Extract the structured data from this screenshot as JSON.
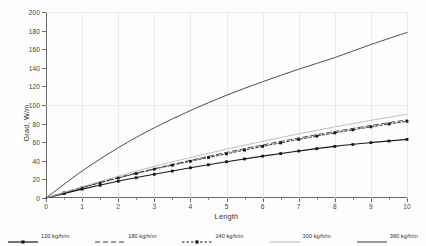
{
  "chart_data": {
    "type": "line",
    "title": "",
    "xlabel": "Length",
    "ylabel": "Grad, W/m",
    "xlim": [
      0,
      10
    ],
    "ylim": [
      0,
      200
    ],
    "xticks": [
      "0",
      "1",
      "2",
      "3",
      "4",
      "5",
      "6",
      "7",
      "8",
      "9",
      "10"
    ],
    "yticks": [
      "0",
      "20",
      "40",
      "60",
      "80",
      "100",
      "120",
      "140",
      "160",
      "180",
      "200"
    ],
    "grid": true,
    "legend_position": "bottom",
    "x": [
      0,
      1,
      2,
      3,
      4,
      5,
      6,
      7,
      8,
      9,
      10
    ],
    "series": [
      {
        "name": "120 kg/h/m",
        "style": "solid-markers",
        "color": "#1a1a1a",
        "values": [
          0,
          9.5,
          18.0,
          25.5,
          32.5,
          39.0,
          45.0,
          50.5,
          55.5,
          59.5,
          63.0
        ]
      },
      {
        "name": "180 kg/h/m",
        "style": "dashed",
        "color": "#3a3a3a",
        "values": [
          0,
          11.5,
          22.0,
          31.5,
          40.5,
          49.0,
          57.0,
          64.5,
          71.5,
          78.0,
          84.0
        ]
      },
      {
        "name": "240 kg/h/m",
        "style": "dashed-markers",
        "color": "#1a1a1a",
        "values": [
          0,
          11.0,
          21.5,
          31.0,
          39.5,
          47.5,
          55.5,
          63.0,
          70.0,
          76.5,
          82.5
        ]
      },
      {
        "name": "300 kg/h/m",
        "style": "solid-light",
        "color": "#b8b8b8",
        "values": [
          0,
          12.0,
          23.5,
          34.0,
          43.5,
          52.5,
          61.0,
          69.0,
          76.5,
          83.5,
          90.0
        ]
      },
      {
        "name": "360 kg/h/m",
        "style": "solid",
        "color": "#3a3a3a",
        "values": [
          0,
          29.0,
          54.0,
          75.5,
          94.0,
          110.5,
          125.0,
          138.5,
          151.0,
          165.0,
          178.0
        ]
      }
    ]
  },
  "axis": {
    "y_title": "Grad, W/m",
    "x_title": "Length"
  },
  "legend": {
    "items": [
      {
        "label": "120 kg/h/m"
      },
      {
        "label": "180 kg/h/m"
      },
      {
        "label": "240 kg/h/m"
      },
      {
        "label": "300 kg/h/m"
      },
      {
        "label": "360 kg/h/m"
      }
    ]
  }
}
